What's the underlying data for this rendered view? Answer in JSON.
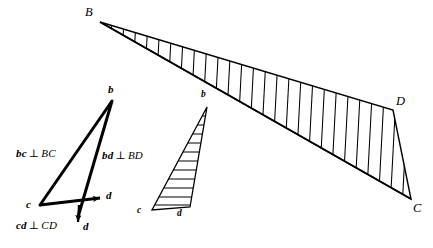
{
  "figure": {
    "type": "engineering-vector-diagram",
    "title": "",
    "background_color": "#ffffff",
    "stroke_color": "#000000",
    "space_diagram": {
      "name": "space-diagram",
      "shape": "quadrilateral",
      "vertices": [
        {
          "id": "B",
          "label": "B",
          "x": 100,
          "y": 22
        },
        {
          "id": "D",
          "label": "D",
          "x": 393,
          "y": 110
        },
        {
          "id": "C",
          "label": "C",
          "x": 411,
          "y": 199
        },
        {
          "id": "B2",
          "label": "",
          "x": 100,
          "y": 22
        }
      ],
      "labels": [
        {
          "name": "vertex-label-B",
          "text": "B",
          "x": 85,
          "y": 6
        },
        {
          "name": "vertex-label-D",
          "text": "D",
          "x": 396,
          "y": 96
        },
        {
          "name": "vertex-label-C",
          "text": "C",
          "x": 414,
          "y": 203
        }
      ],
      "hatch": {
        "style": "oblique-parallel-lines",
        "count": 25,
        "angle_deg": 72
      }
    },
    "vector_diagram_large": {
      "name": "vector-diagram-large",
      "points": [
        {
          "id": "b",
          "label": "b",
          "x": 112,
          "y": 101
        },
        {
          "id": "c",
          "label": "c",
          "x": 40,
          "y": 205
        },
        {
          "id": "d",
          "label": "d",
          "x": 101,
          "y": 198
        },
        {
          "id": "d2",
          "label": "d",
          "x": 78,
          "y": 224
        }
      ],
      "labels": [
        {
          "name": "vector-point-label-b",
          "text": "b",
          "x": 108,
          "y": 86
        },
        {
          "name": "vector-point-label-c",
          "text": "c",
          "x": 26,
          "y": 201
        },
        {
          "name": "vector-point-label-d-right",
          "text": "d",
          "x": 107,
          "y": 190
        },
        {
          "name": "vector-point-label-d-bottom",
          "text": "d",
          "x": 82,
          "y": 222
        }
      ]
    },
    "vector_diagram_small": {
      "name": "vector-diagram-small",
      "points": [
        {
          "id": "b",
          "label": "b",
          "x": 207,
          "y": 107
        },
        {
          "id": "c",
          "label": "c",
          "x": 152,
          "y": 210
        },
        {
          "id": "d",
          "label": "d",
          "x": 190,
          "y": 207
        }
      ],
      "labels": [
        {
          "name": "small-point-label-b",
          "text": "b",
          "x": 201,
          "y": 93
        },
        {
          "name": "small-point-label-c",
          "text": "c",
          "x": 138,
          "y": 207
        },
        {
          "name": "small-point-label-d",
          "text": "d",
          "x": 178,
          "y": 209
        }
      ],
      "hatch": {
        "style": "horizontal-parallel-lines",
        "count": 11
      }
    },
    "annotations": [
      {
        "name": "annotation-bc-perp-BC",
        "vector": "bc",
        "symbol": "⊥",
        "segment": "BC",
        "x": 16,
        "y": 148
      },
      {
        "name": "annotation-bd-perp-BD",
        "vector": "bd",
        "symbol": "⊥",
        "segment": "BD",
        "x": 102,
        "y": 150
      },
      {
        "name": "annotation-cd-perp-CD",
        "vector": "cd",
        "symbol": "⊥",
        "segment": "CD",
        "x": 16,
        "y": 220
      }
    ]
  }
}
